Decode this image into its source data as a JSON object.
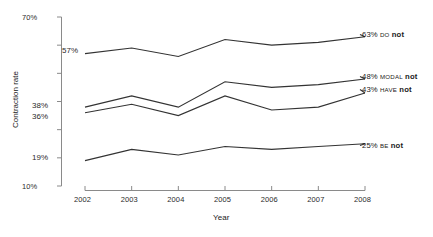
{
  "chart_data": {
    "type": "line",
    "title": "",
    "xlabel": "Year",
    "ylabel": "Contraction rate",
    "x": [
      2002,
      2003,
      2004,
      2005,
      2006,
      2007,
      2008
    ],
    "xtick_labels": [
      "2002",
      "2003",
      "2004",
      "2005",
      "2006",
      "2007",
      "2008"
    ],
    "xlim": [
      2002,
      2008
    ],
    "ylim": [
      10,
      70
    ],
    "ytick_labels": [
      "70%",
      "10%"
    ],
    "ytick_values": [
      70,
      60,
      50,
      40,
      30,
      20,
      10
    ],
    "ytick_labels_shown": [
      "70%",
      "",
      "",
      "",
      "",
      "",
      "10%"
    ],
    "ylabel_suffix": "%",
    "grid": false,
    "legend": "right-inline-end-labels",
    "series": [
      {
        "name": "DO not",
        "aux": "DO",
        "negator": "not",
        "start_label": "57%",
        "end_label": "63%",
        "values": [
          57,
          59,
          56,
          62,
          60,
          61,
          63
        ]
      },
      {
        "name": "MODAL not",
        "aux": "MODAL",
        "negator": "not",
        "start_label": "38%",
        "end_label": "48%",
        "values": [
          38,
          42,
          38,
          47,
          45,
          46,
          48
        ]
      },
      {
        "name": "HAVE not",
        "aux": "HAVE",
        "negator": "not",
        "start_label": "36%",
        "end_label": "43%",
        "values": [
          36,
          39,
          35,
          42,
          37,
          38,
          43
        ]
      },
      {
        "name": "BE not",
        "aux": "BE",
        "negator": "not",
        "start_label": "19%",
        "end_label": "25%",
        "values": [
          19,
          23,
          21,
          24,
          23,
          24,
          25
        ]
      }
    ]
  },
  "axes": {
    "y_title": "Contraction rate",
    "x_title": "Year",
    "y_top_label": "70%",
    "y_bottom_label": "10%"
  },
  "inner_labels": {
    "do_start": "57%",
    "modal_start": "38%",
    "have_start": "36%",
    "be_start": "19%"
  },
  "end_labels": {
    "do": {
      "pct": "63%",
      "aux": "DO",
      "neg": "not"
    },
    "modal": {
      "pct": "48%",
      "aux": "MODAL",
      "neg": "not"
    },
    "have": {
      "pct": "43%",
      "aux": "HAVE",
      "neg": "not"
    },
    "be": {
      "pct": "25%",
      "aux": "BE",
      "neg": "not"
    }
  },
  "xticks": [
    "2002",
    "2003",
    "2004",
    "2005",
    "2006",
    "2007",
    "2008"
  ]
}
